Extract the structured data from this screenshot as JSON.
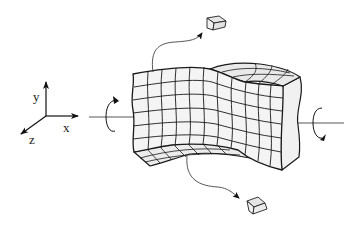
{
  "diagram": {
    "axes": {
      "labels": {
        "x": "x",
        "y": "y",
        "z": "z"
      }
    },
    "colors": {
      "line": "#1a1a1a",
      "face_front": "#f3f3f3",
      "face_top": "#ececec",
      "face_side": "#f0f0f0",
      "thin_line": "#555555"
    },
    "grid": {
      "front_columns": 10,
      "front_rows": 6,
      "side_columns": 4
    },
    "elements": [
      {
        "name": "top-extracted-cube"
      },
      {
        "name": "bottom-extracted-cube"
      }
    ],
    "rotation_arrows": [
      "left-twist-arrow",
      "right-twist-arrow"
    ]
  }
}
